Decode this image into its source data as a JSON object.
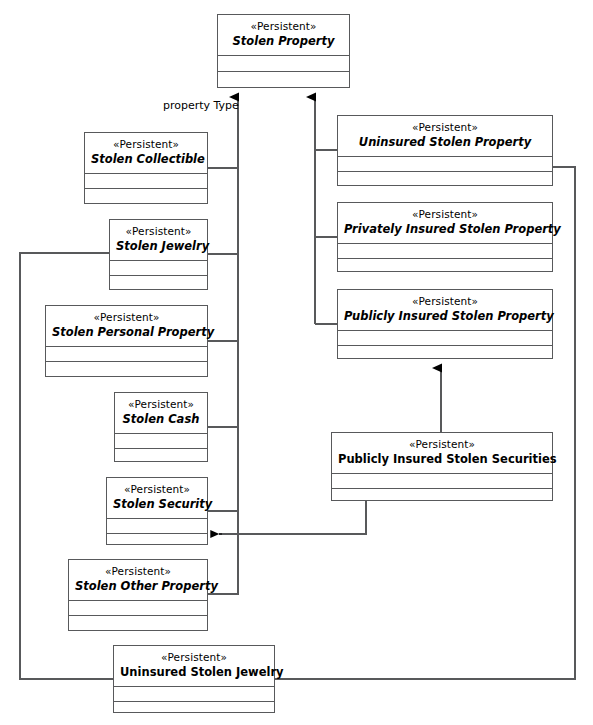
{
  "diagram": {
    "stereotype": "«Persistent»",
    "line_color": "#58595b",
    "background": "#ffffff"
  },
  "edge_labels": [
    {
      "id": "property-type",
      "text": "property Type",
      "x": 163,
      "y": 99
    }
  ],
  "classes": [
    {
      "id": "stolen-property",
      "stereotype": "«Persistent»",
      "name": "Stolen Property",
      "kind": "abstract",
      "x": 217,
      "y": 14,
      "w": 133,
      "h": 74
    },
    {
      "id": "stolen-collectible",
      "stereotype": "«Persistent»",
      "name": "Stolen Collectible",
      "kind": "abstract",
      "x": 84,
      "y": 132,
      "w": 124,
      "h": 72
    },
    {
      "id": "stolen-jewelry",
      "stereotype": "«Persistent»",
      "name": "Stolen Jewelry",
      "kind": "abstract",
      "x": 109,
      "y": 219,
      "w": 99,
      "h": 71
    },
    {
      "id": "stolen-personal-property",
      "stereotype": "«Persistent»",
      "name": "Stolen Personal Property",
      "kind": "abstract",
      "x": 45,
      "y": 305,
      "w": 163,
      "h": 72
    },
    {
      "id": "stolen-cash",
      "stereotype": "«Persistent»",
      "name": "Stolen Cash",
      "kind": "abstract",
      "x": 114,
      "y": 392,
      "w": 94,
      "h": 70
    },
    {
      "id": "stolen-security",
      "stereotype": "«Persistent»",
      "name": "Stolen Security",
      "kind": "abstract",
      "x": 106,
      "y": 477,
      "w": 102,
      "h": 68
    },
    {
      "id": "stolen-other-property",
      "stereotype": "«Persistent»",
      "name": "Stolen Other Property",
      "kind": "abstract",
      "x": 68,
      "y": 559,
      "w": 140,
      "h": 72
    },
    {
      "id": "uninsured-stolen-property",
      "stereotype": "«Persistent»",
      "name": "Uninsured Stolen Property",
      "kind": "abstract",
      "x": 337,
      "y": 115,
      "w": 216,
      "h": 71
    },
    {
      "id": "privately-insured-stolen-property",
      "stereotype": "«Persistent»",
      "name": "Privately Insured Stolen Property",
      "kind": "abstract",
      "x": 337,
      "y": 202,
      "w": 216,
      "h": 70
    },
    {
      "id": "publicly-insured-stolen-property",
      "stereotype": "«Persistent»",
      "name": "Publicly Insured Stolen Property",
      "kind": "abstract",
      "x": 337,
      "y": 289,
      "w": 216,
      "h": 70
    },
    {
      "id": "publicly-insured-stolen-securities",
      "stereotype": "«Persistent»",
      "name": "Publicly Insured Stolen Securities",
      "kind": "concrete",
      "x": 331,
      "y": 432,
      "w": 222,
      "h": 69
    },
    {
      "id": "uninsured-stolen-jewelry",
      "stereotype": "«Persistent»",
      "name": "Uninsured Stolen Jewelry",
      "kind": "concrete",
      "x": 113,
      "y": 645,
      "w": 162,
      "h": 68
    }
  ],
  "connectors": [
    {
      "id": "gen-left-trunk-to-stolen-property",
      "type": "generalization",
      "source": "left subclasses",
      "target": "stolen-property",
      "arrow": "hollow-triangle-filled",
      "arrow_at": {
        "x": 238,
        "y": 88
      }
    },
    {
      "id": "gen-right-trunk-to-stolen-property",
      "type": "generalization",
      "source": "right subclasses",
      "target": "stolen-property",
      "arrow": "hollow-triangle-filled",
      "arrow_at": {
        "x": 315,
        "y": 88
      }
    },
    {
      "id": "gen-securities-to-publicly-insured",
      "type": "generalization",
      "source": "publicly-insured-stolen-securities",
      "target": "publicly-insured-stolen-property",
      "arrow": "hollow-triangle-filled",
      "arrow_at": {
        "x": 441,
        "y": 359
      }
    },
    {
      "id": "dep-securities-to-stolen-security",
      "type": "dependency",
      "source": "publicly-insured-stolen-securities",
      "target": "stolen-security",
      "arrow": "open-arrow",
      "arrow_at": {
        "x": 209,
        "y": 534
      }
    },
    {
      "id": "dep-jewelry-to-stolen-jewelry",
      "type": "dependency",
      "source": "uninsured-stolen-jewelry",
      "target": "stolen-jewelry",
      "arrow": "open-arrow",
      "arrow_at": {
        "x": 109,
        "y": 253
      }
    },
    {
      "id": "dep-jewelry-to-uninsured-stolen-property",
      "type": "dependency",
      "source": "uninsured-stolen-jewelry",
      "target": "uninsured-stolen-property",
      "arrow": "open-arrow",
      "arrow_at": {
        "x": 553,
        "y": 167
      }
    }
  ]
}
